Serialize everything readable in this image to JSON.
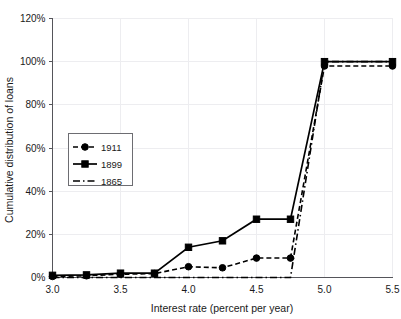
{
  "chart_data": {
    "type": "line",
    "title": "",
    "xlabel": "Interest rate (percent per year)",
    "ylabel": "Cumulative distribution of loans",
    "xlim": [
      3.0,
      5.5
    ],
    "ylim": [
      0,
      120
    ],
    "xticks": [
      "3.0",
      "3.5",
      "4.0",
      "4.5",
      "5.0",
      "5.5"
    ],
    "xtick_values": [
      3.0,
      3.5,
      4.0,
      4.5,
      5.0,
      5.5
    ],
    "yticks": [
      "0%",
      "20%",
      "40%",
      "60%",
      "80%",
      "100%",
      "120%"
    ],
    "ytick_values": [
      0,
      20,
      40,
      60,
      80,
      100,
      120
    ],
    "grid": true,
    "legend_position": "left-middle",
    "series": [
      {
        "name": "1911",
        "style": "dotted-dashed",
        "marker": "circle",
        "x": [
          3.0,
          3.25,
          3.5,
          3.75,
          4.0,
          4.25,
          4.5,
          4.75,
          5.0,
          5.5
        ],
        "values": [
          0.5,
          0.8,
          1.5,
          1.8,
          5.0,
          4.5,
          9.0,
          9.0,
          98.0,
          98.0
        ]
      },
      {
        "name": "1899",
        "style": "solid",
        "marker": "square",
        "x": [
          3.0,
          3.25,
          3.5,
          3.75,
          4.0,
          4.25,
          4.5,
          4.75,
          5.0,
          5.5
        ],
        "values": [
          1.0,
          1.2,
          2.0,
          2.0,
          14.0,
          17.0,
          27.0,
          27.0,
          100.0,
          100.0
        ]
      },
      {
        "name": "1865",
        "style": "dash-dot",
        "marker": "none",
        "x": [
          3.0,
          3.5,
          4.0,
          4.5,
          4.75,
          5.0,
          5.5
        ],
        "values": [
          0.0,
          0.0,
          0.0,
          0.0,
          0.0,
          100.0,
          100.0
        ]
      }
    ]
  },
  "legend": {
    "entries": [
      {
        "label": "1911"
      },
      {
        "label": "1899"
      },
      {
        "label": "1865"
      }
    ]
  },
  "colors": {
    "series": "#000000",
    "grid": "#ededf0",
    "axis": "#55555a",
    "background": "#ffffff"
  }
}
